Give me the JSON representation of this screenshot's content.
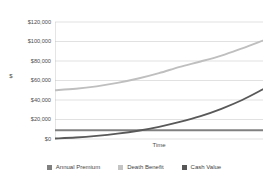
{
  "chart_data": {
    "type": "line",
    "title": "",
    "xlabel": "Time",
    "ylabel": "$",
    "ylim": [
      0,
      120000
    ],
    "ytick_labels": [
      "$120,000",
      "$100,000",
      "$80,000",
      "$60,000",
      "$40,000",
      "$20,000",
      "$0"
    ],
    "ytick_values": [
      120000,
      100000,
      80000,
      60000,
      40000,
      20000,
      0
    ],
    "xtick_labels": [],
    "grid": true,
    "legend_position": "bottom",
    "x": [
      0,
      1,
      2,
      3,
      4,
      5,
      6,
      7,
      8,
      9,
      10
    ],
    "series": [
      {
        "name": "Annual Premium",
        "color": "#808080",
        "values": [
          9000,
          9000,
          9000,
          9000,
          9000,
          9000,
          9000,
          9000,
          9000,
          9000,
          9000
        ]
      },
      {
        "name": "Death Benefit",
        "color": "#bfbfbf",
        "values": [
          50000,
          51500,
          54000,
          57500,
          62000,
          67500,
          74000,
          79500,
          85500,
          93000,
          101000
        ]
      },
      {
        "name": "Cash Value",
        "color": "#595959",
        "values": [
          500,
          1500,
          3200,
          5500,
          8500,
          12500,
          17500,
          23500,
          31000,
          40000,
          51000
        ]
      }
    ]
  },
  "legend": {
    "items": [
      {
        "label": "Annual Premium",
        "color": "#808080"
      },
      {
        "label": "Death Benefit",
        "color": "#c4c4c4"
      },
      {
        "label": "Cash Value",
        "color": "#575757"
      }
    ]
  },
  "axes": {
    "y_title": "$",
    "x_title": "Time"
  },
  "colors": {
    "background": "#ffffff",
    "gridline": "#d9d9d9",
    "axis_line": "#bfbfbf",
    "text": "#4c4c4c"
  }
}
